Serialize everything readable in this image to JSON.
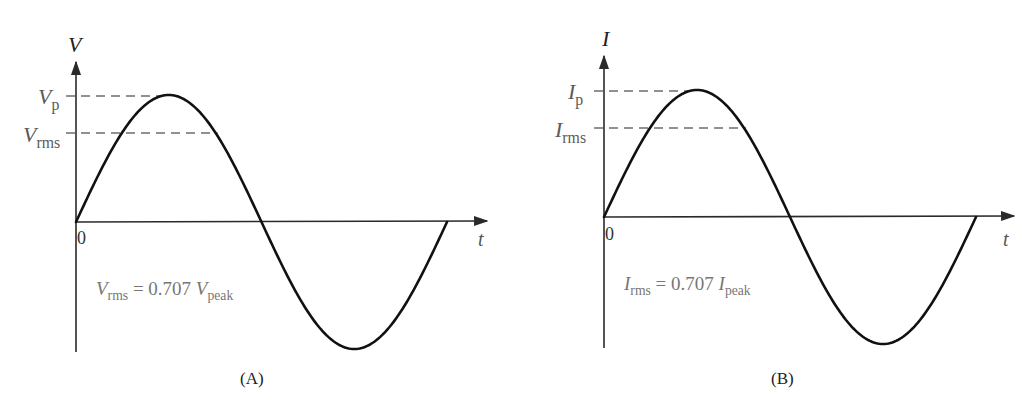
{
  "panels": [
    {
      "id": "A",
      "caption": "(A)",
      "y_axis_label": "V",
      "x_axis_label": "t",
      "origin_label": "0",
      "peak_label": {
        "symbol": "V",
        "sub": "p"
      },
      "rms_label": {
        "symbol": "V",
        "sub": "rms"
      },
      "equation": {
        "lhs_symbol": "V",
        "lhs_sub": "rms",
        "op": " = 0.707 ",
        "rhs_symbol": "V",
        "rhs_sub": "peak"
      },
      "geometry": {
        "origin": [
          76,
          222
        ],
        "peak": [
          168,
          95
        ],
        "trough": [
          356,
          349
        ],
        "end": [
          447,
          221
        ],
        "rms_y": 133,
        "axis_top": 62,
        "axis_bottom": 352,
        "axis_right": 487
      }
    },
    {
      "id": "B",
      "caption": "(B)",
      "y_axis_label": "I",
      "x_axis_label": "t",
      "origin_label": "0",
      "peak_label": {
        "symbol": "I",
        "sub": "p"
      },
      "rms_label": {
        "symbol": "I",
        "sub": "rms"
      },
      "equation": {
        "lhs_symbol": "I",
        "lhs_sub": "rms",
        "op": " = 0.707 ",
        "rhs_symbol": "I",
        "rhs_sub": "peak"
      },
      "geometry": {
        "origin": [
          604,
          217
        ],
        "peak": [
          697,
          90
        ],
        "trough": [
          885,
          344
        ],
        "end": [
          976,
          216
        ],
        "rms_y": 128,
        "axis_top": 56,
        "axis_bottom": 348,
        "axis_right": 1014
      }
    }
  ],
  "colors": {
    "wave": "#111111",
    "axis": "#2a2a2a",
    "dash": "#6e6e6e",
    "label": "#5a5a5a"
  },
  "chart_data": [
    {
      "type": "line",
      "title": "(A)",
      "xlabel": "t",
      "ylabel": "V",
      "series": [
        {
          "name": "V(t) = Vp sin(ωt)",
          "shape": "sine, one full period"
        }
      ],
      "reference_lines": [
        {
          "label": "Vp",
          "value": 1.0
        },
        {
          "label": "Vrms",
          "value": 0.707
        }
      ],
      "annotation": "Vrms = 0.707 Vpeak"
    },
    {
      "type": "line",
      "title": "(B)",
      "xlabel": "t",
      "ylabel": "I",
      "series": [
        {
          "name": "I(t) = Ip sin(ωt)",
          "shape": "sine, one full period"
        }
      ],
      "reference_lines": [
        {
          "label": "Ip",
          "value": 1.0
        },
        {
          "label": "Irms",
          "value": 0.707
        }
      ],
      "annotation": "Irms = 0.707 Ipeak"
    }
  ]
}
